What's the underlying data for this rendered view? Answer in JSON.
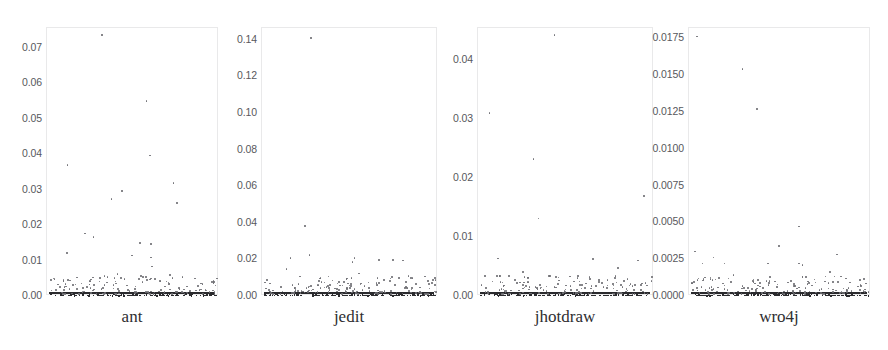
{
  "figure": {
    "width": 888,
    "height": 350,
    "background": "#ffffff",
    "point_color": "#6e6e73",
    "dense_point_color": "#2b2b2e",
    "frame_color": "#e9e9ea",
    "tick_label_color": "#58585c",
    "panel_label_color": "#2e2e31"
  },
  "chart_data": {
    "type": "scatter",
    "title": "",
    "xlabel": "",
    "ylabel": "",
    "grid": false,
    "legend": null,
    "layout": "1x4 small-multiples",
    "panels": [
      {
        "name": "ant",
        "label": "ant",
        "ylim": [
          0.0,
          0.0755
        ],
        "yticks": [
          0.0,
          0.01,
          0.02,
          0.03,
          0.04,
          0.05,
          0.06,
          0.07
        ],
        "ytick_labels": [
          "0.00",
          "0.01",
          "0.02",
          "0.03",
          "0.04",
          "0.05",
          "0.06",
          "0.07"
        ],
        "xlim": [
          0,
          1
        ],
        "xticks": [],
        "n_points": 250,
        "outliers": [
          {
            "x": 0.315,
            "y": 0.0735
          },
          {
            "x": 0.575,
            "y": 0.0548
          },
          {
            "x": 0.595,
            "y": 0.0395
          },
          {
            "x": 0.115,
            "y": 0.0368
          },
          {
            "x": 0.73,
            "y": 0.0318
          },
          {
            "x": 0.43,
            "y": 0.0296
          },
          {
            "x": 0.37,
            "y": 0.0272
          },
          {
            "x": 0.75,
            "y": 0.0262
          },
          {
            "x": 0.215,
            "y": 0.0176
          },
          {
            "x": 0.265,
            "y": 0.0165
          },
          {
            "x": 0.535,
            "y": 0.0148
          },
          {
            "x": 0.6,
            "y": 0.0146
          },
          {
            "x": 0.11,
            "y": 0.012
          },
          {
            "x": 0.49,
            "y": 0.0113
          },
          {
            "x": 0.6,
            "y": 0.0108
          },
          {
            "x": 0.605,
            "y": 0.0082
          },
          {
            "x": 0.405,
            "y": 0.0062
          },
          {
            "x": 0.71,
            "y": 0.0058
          },
          {
            "x": 0.53,
            "y": 0.0048
          },
          {
            "x": 0.25,
            "y": 0.0046
          },
          {
            "x": 0.577,
            "y": 0.0044
          },
          {
            "x": 0.69,
            "y": 0.004
          },
          {
            "x": 0.345,
            "y": 0.0038
          },
          {
            "x": 0.703,
            "y": 0.0035
          },
          {
            "x": 0.16,
            "y": 0.0032
          },
          {
            "x": 0.33,
            "y": 0.003
          },
          {
            "x": 0.46,
            "y": 0.0029
          },
          {
            "x": 0.68,
            "y": 0.0026
          },
          {
            "x": 0.098,
            "y": 0.0024
          },
          {
            "x": 0.205,
            "y": 0.0022
          }
        ]
      },
      {
        "name": "jedit",
        "label": "jedit",
        "ylim": [
          0.0,
          0.1465
        ],
        "yticks": [
          0.0,
          0.02,
          0.04,
          0.06,
          0.08,
          0.1,
          0.12,
          0.14
        ],
        "ytick_labels": [
          "0.00",
          "0.02",
          "0.04",
          "0.06",
          "0.08",
          "0.10",
          "0.12",
          "0.14"
        ],
        "xlim": [
          0,
          1
        ],
        "xticks": [],
        "n_points": 300,
        "outliers": [
          {
            "x": 0.275,
            "y": 0.1408
          },
          {
            "x": 0.24,
            "y": 0.0383
          },
          {
            "x": 0.265,
            "y": 0.0222
          },
          {
            "x": 0.158,
            "y": 0.0207
          },
          {
            "x": 0.52,
            "y": 0.0205
          },
          {
            "x": 0.66,
            "y": 0.0196
          },
          {
            "x": 0.74,
            "y": 0.0195
          },
          {
            "x": 0.795,
            "y": 0.0193
          },
          {
            "x": 0.51,
            "y": 0.0185
          },
          {
            "x": 0.135,
            "y": 0.0148
          },
          {
            "x": 0.545,
            "y": 0.0122
          },
          {
            "x": 0.69,
            "y": 0.0085
          },
          {
            "x": 0.46,
            "y": 0.0076
          },
          {
            "x": 0.6,
            "y": 0.0072
          },
          {
            "x": 0.04,
            "y": 0.0068
          },
          {
            "x": 0.555,
            "y": 0.0062
          },
          {
            "x": 0.31,
            "y": 0.0058
          },
          {
            "x": 0.265,
            "y": 0.005
          },
          {
            "x": 0.35,
            "y": 0.0046
          },
          {
            "x": 0.82,
            "y": 0.0044
          },
          {
            "x": 0.18,
            "y": 0.0042
          },
          {
            "x": 0.42,
            "y": 0.0038
          },
          {
            "x": 0.48,
            "y": 0.0036
          }
        ]
      },
      {
        "name": "jhotdraw",
        "label": "jhotdraw",
        "ylim": [
          0.0,
          0.0455
        ],
        "yticks": [
          0.0,
          0.01,
          0.02,
          0.03,
          0.04
        ],
        "ytick_labels": [
          "0.00",
          "0.01",
          "0.02",
          "0.03",
          "0.04"
        ],
        "xlim": [
          0,
          1
        ],
        "xticks": [],
        "n_points": 260,
        "outliers": [
          {
            "x": 0.43,
            "y": 0.0443
          },
          {
            "x": 0.06,
            "y": 0.031
          },
          {
            "x": 0.31,
            "y": 0.0232
          },
          {
            "x": 0.94,
            "y": 0.0169
          },
          {
            "x": 0.34,
            "y": 0.0131
          },
          {
            "x": 0.11,
            "y": 0.0063
          },
          {
            "x": 0.65,
            "y": 0.0062
          },
          {
            "x": 0.905,
            "y": 0.006
          },
          {
            "x": 0.79,
            "y": 0.0047
          },
          {
            "x": 0.25,
            "y": 0.004
          },
          {
            "x": 0.17,
            "y": 0.0034
          },
          {
            "x": 0.63,
            "y": 0.0032
          },
          {
            "x": 0.56,
            "y": 0.003
          },
          {
            "x": 0.845,
            "y": 0.0029
          },
          {
            "x": 0.54,
            "y": 0.0024
          },
          {
            "x": 0.7,
            "y": 0.0022
          },
          {
            "x": 0.45,
            "y": 0.002
          }
        ]
      },
      {
        "name": "wro4j",
        "label": "wro4j",
        "ylim": [
          0.0,
          0.0182
        ],
        "yticks": [
          0.0,
          0.0025,
          0.005,
          0.0075,
          0.01,
          0.0125,
          0.015,
          0.0175
        ],
        "ytick_labels": [
          "0.0000",
          "0.0025",
          "0.0050",
          "0.0075",
          "0.0100",
          "0.0125",
          "0.0150",
          "0.0175"
        ],
        "xlim": [
          0,
          1
        ],
        "xticks": [],
        "n_points": 300,
        "outliers": [
          {
            "x": 0.04,
            "y": 0.0176
          },
          {
            "x": 0.29,
            "y": 0.0154
          },
          {
            "x": 0.37,
            "y": 0.0127
          },
          {
            "x": 0.6,
            "y": 0.0047
          },
          {
            "x": 0.49,
            "y": 0.0034
          },
          {
            "x": 0.03,
            "y": 0.003
          },
          {
            "x": 0.81,
            "y": 0.0028
          },
          {
            "x": 0.13,
            "y": 0.0026
          },
          {
            "x": 0.07,
            "y": 0.0022
          },
          {
            "x": 0.19,
            "y": 0.0022
          },
          {
            "x": 0.43,
            "y": 0.0022
          },
          {
            "x": 0.6,
            "y": 0.0022
          },
          {
            "x": 0.62,
            "y": 0.0021
          },
          {
            "x": 0.77,
            "y": 0.0016
          },
          {
            "x": 0.24,
            "y": 0.0014
          },
          {
            "x": 0.745,
            "y": 0.0013
          },
          {
            "x": 0.16,
            "y": 0.0012
          },
          {
            "x": 0.35,
            "y": 0.0011
          },
          {
            "x": 0.555,
            "y": 0.001
          },
          {
            "x": 0.69,
            "y": 0.0009
          }
        ]
      }
    ]
  },
  "panel_geometry": [
    {
      "frame_left": 46,
      "frame_top": 27,
      "frame_width": 172,
      "frame_height": 268,
      "label_left": 46,
      "label_width": 172,
      "label_top": 307,
      "tick_right": 42
    },
    {
      "frame_left": 261,
      "frame_top": 27,
      "frame_width": 176,
      "frame_height": 268,
      "label_left": 261,
      "label_width": 176,
      "label_top": 307,
      "tick_right": 257
    },
    {
      "frame_left": 477,
      "frame_top": 27,
      "frame_width": 176,
      "frame_height": 268,
      "label_left": 477,
      "label_width": 176,
      "label_top": 307,
      "tick_right": 473
    },
    {
      "frame_left": 688,
      "frame_top": 27,
      "frame_width": 182,
      "frame_height": 268,
      "label_left": 688,
      "label_width": 182,
      "label_top": 307,
      "tick_right": 684
    }
  ]
}
